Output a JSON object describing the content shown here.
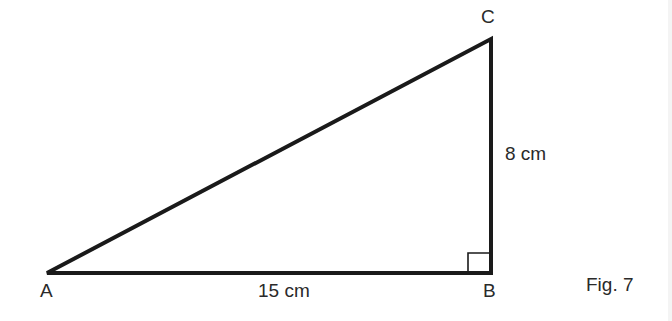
{
  "figure": {
    "caption": "Fig. 7",
    "type": "right triangle",
    "vertices": [
      {
        "name": "A",
        "label": "A"
      },
      {
        "name": "B",
        "label": "B"
      },
      {
        "name": "C",
        "label": "C"
      }
    ],
    "sides": {
      "AB": {
        "label": "15 cm",
        "length_cm": 15
      },
      "BC": {
        "label": "8 cm",
        "length_cm": 8
      }
    },
    "right_angle_at": "B",
    "colors": {
      "stroke": "#1a1a1a",
      "background": "#ffffff"
    }
  }
}
